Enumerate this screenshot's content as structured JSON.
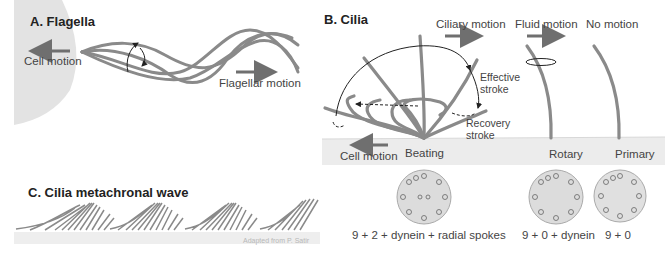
{
  "panel_a": {
    "title": "A. Flagella",
    "cell_motion_label": "Cell motion",
    "flagellar_motion_label": "Flagellar motion"
  },
  "panel_b": {
    "title": "B. Cilia",
    "ciliary_motion_label": "Ciliary motion",
    "fluid_motion_label": "Fluid motion",
    "no_motion_label": "No motion",
    "effective_stroke_label": [
      "Effective",
      "stroke"
    ],
    "recovery_stroke_label": [
      "Recovery",
      "stroke"
    ],
    "cell_motion_label": "Cell motion",
    "types": [
      {
        "name": "Beating",
        "structure": "9 + 2 + dynein + radial spokes"
      },
      {
        "name": "Rotary",
        "structure": "9 + 0 + dynein"
      },
      {
        "name": "Primary",
        "structure": "9 + 0"
      }
    ]
  },
  "panel_c": {
    "title": "C. Cilia metachronal wave",
    "credit": "Adapted from P. Satir"
  },
  "colors": {
    "cilium": "#8a8a8a",
    "cell_fill": "#e2e2e2",
    "surface_fill": "#ededed",
    "arrow": "#6f6f6f",
    "text": "#333333"
  }
}
